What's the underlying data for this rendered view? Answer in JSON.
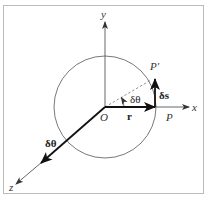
{
  "diagram": {
    "type": "rotation-vector-diagram",
    "axes": {
      "x_label": "x",
      "y_label": "y",
      "z_label": "z"
    },
    "points": {
      "origin_label": "O",
      "p_label": "P",
      "p_prime_label": "P′"
    },
    "vectors": {
      "r_label": "r",
      "ds_label": "δs",
      "dtheta_vector_label": "δθ"
    },
    "angle_label": "δθ",
    "colors": {
      "line": "#222222",
      "thin_line": "#555555",
      "circle": "#555555",
      "dashed": "#777777",
      "border": "#bbbbbb"
    }
  }
}
